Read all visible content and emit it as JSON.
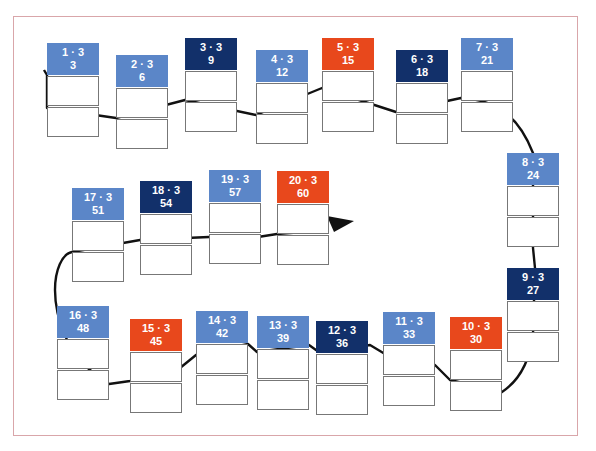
{
  "diagram": {
    "title": "",
    "arrow_direction": "ends after tile 20 pointing right",
    "colors": {
      "light_blue": "#5b86c8",
      "dark_blue": "#12306a",
      "orange": "#e8481c",
      "frame": "#d9a6aa",
      "path": "#111111"
    },
    "tiles": [
      {
        "expr": "1 · 3",
        "value": "3",
        "color": "light_blue"
      },
      {
        "expr": "2 · 3",
        "value": "6",
        "color": "light_blue"
      },
      {
        "expr": "3 · 3",
        "value": "9",
        "color": "dark_blue"
      },
      {
        "expr": "4 · 3",
        "value": "12",
        "color": "light_blue"
      },
      {
        "expr": "5 · 3",
        "value": "15",
        "color": "orange"
      },
      {
        "expr": "6 · 3",
        "value": "18",
        "color": "dark_blue"
      },
      {
        "expr": "7 · 3",
        "value": "21",
        "color": "light_blue"
      },
      {
        "expr": "8 · 3",
        "value": "24",
        "color": "light_blue"
      },
      {
        "expr": "9 · 3",
        "value": "27",
        "color": "dark_blue"
      },
      {
        "expr": "10 · 3",
        "value": "30",
        "color": "orange"
      },
      {
        "expr": "11 · 3",
        "value": "33",
        "color": "light_blue"
      },
      {
        "expr": "12 · 3",
        "value": "36",
        "color": "dark_blue"
      },
      {
        "expr": "13 · 3",
        "value": "39",
        "color": "light_blue"
      },
      {
        "expr": "14 · 3",
        "value": "42",
        "color": "light_blue"
      },
      {
        "expr": "15 · 3",
        "value": "45",
        "color": "orange"
      },
      {
        "expr": "16 · 3",
        "value": "48",
        "color": "light_blue"
      },
      {
        "expr": "17 · 3",
        "value": "51",
        "color": "light_blue"
      },
      {
        "expr": "18 · 3",
        "value": "54",
        "color": "dark_blue"
      },
      {
        "expr": "19 · 3",
        "value": "57",
        "color": "light_blue"
      },
      {
        "expr": "20 · 3",
        "value": "60",
        "color": "orange"
      }
    ]
  }
}
